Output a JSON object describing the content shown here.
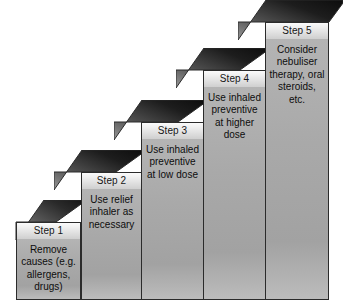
{
  "diagram": {
    "type": "staircase",
    "background_color": "#ffffff",
    "band_fill": "#e3e3e3",
    "body_fill": "#a9a9a9",
    "riser_dark": "#141414",
    "riser_light": "#8f8f8f",
    "outline_color": "#2b2b2b",
    "steps": [
      {
        "id": "step-1",
        "label": "Step 1",
        "text": "Remove causes (e.g. allergens, drugs)"
      },
      {
        "id": "step-2",
        "label": "Step 2",
        "text": "Use relief inhaler as necessary"
      },
      {
        "id": "step-3",
        "label": "Step 3",
        "text": "Use inhaled preventive at low dose"
      },
      {
        "id": "step-4",
        "label": "Step 4",
        "text": "Use inhaled preventive at higher dose"
      },
      {
        "id": "step-5",
        "label": "Step 5",
        "text": "Consider nebuliser therapy, oral steroids, etc."
      }
    ]
  }
}
